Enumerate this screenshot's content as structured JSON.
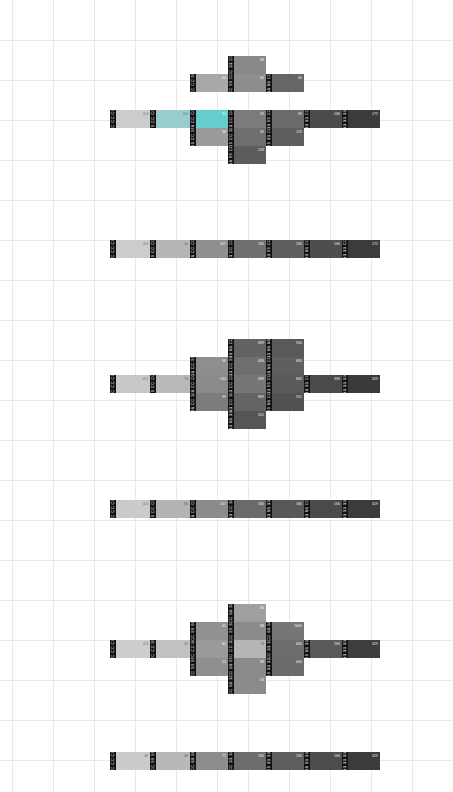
{
  "view": {
    "title": "Web-safe colour palette swatch map",
    "background": "#ffffff",
    "grid_color": "#e9e9e9",
    "badge_bg": "#111111",
    "badge_fg": "#ffffff"
  },
  "grid": {
    "h_lines": [
      40,
      80,
      120,
      160,
      200,
      240,
      280,
      320,
      360,
      400,
      440,
      480,
      520,
      560,
      600,
      640,
      680,
      720,
      760
    ],
    "v_lines": [
      12,
      53,
      94,
      135,
      176,
      217,
      248,
      289,
      330,
      371,
      412,
      453
    ]
  },
  "chart_data": {
    "type": "heatmap",
    "xlabel": "",
    "ylabel": "",
    "clusters": [
      {
        "name": "cluster-1-blue-cross",
        "shape": "cross",
        "cells": [
          {
            "hex": "CC CC CC",
            "color": "#cccccc",
            "pct": "4.3",
            "x": 18,
            "y": 45,
            "w": 40,
            "h": 18,
            "light": true
          },
          {
            "hex": "99 CC CC",
            "color": "#99cccc",
            "pct": "4.5",
            "x": 58,
            "y": 45,
            "w": 40,
            "h": 18,
            "light": true
          },
          {
            "hex": "66 CC CC",
            "color": "#66cccc",
            "pct": "33",
            "x": 98,
            "y": 45,
            "w": 38,
            "h": 18
          },
          {
            "hex": "CC CC 99",
            "color": "#a8a8a8",
            "pct": "64",
            "x": 98,
            "y": 9,
            "w": 38,
            "h": 18
          },
          {
            "hex": "99 CC 99",
            "color": "#9a9a9a",
            "pct": "38",
            "x": 98,
            "y": 63,
            "w": 38,
            "h": 18
          },
          {
            "hex": "33 CC CC",
            "color": "#7b7b7b",
            "pct": "49",
            "x": 136,
            "y": 45,
            "w": 38,
            "h": 18
          },
          {
            "hex": "CC 99 CC",
            "color": "#8d8d8d",
            "pct": "80",
            "x": 136,
            "y": 9,
            "w": 38,
            "h": 18
          },
          {
            "hex": "CC 33 CC",
            "color": "#888888",
            "pct": "88",
            "x": 136,
            "y": -9,
            "w": 38,
            "h": 18
          },
          {
            "hex": "99 CC 33",
            "color": "#6e6e6e",
            "pct": "49",
            "x": 136,
            "y": 63,
            "w": 38,
            "h": 18
          },
          {
            "hex": "66 99 CC",
            "color": "#5c5c5c",
            "pct": "133",
            "x": 136,
            "y": 81,
            "w": 38,
            "h": 18
          },
          {
            "hex": "33 99 CC",
            "color": "#6a6a6a",
            "pct": "98",
            "x": 174,
            "y": 45,
            "w": 38,
            "h": 18
          },
          {
            "hex": "66 66 CC",
            "color": "#666666",
            "pct": "66",
            "x": 174,
            "y": 9,
            "w": 38,
            "h": 18
          },
          {
            "hex": "99 33 CC",
            "color": "#5f5f5f",
            "pct": "119",
            "x": 174,
            "y": 63,
            "w": 38,
            "h": 18
          },
          {
            "hex": "33 33 CC",
            "color": "#4b4b4b",
            "pct": "166",
            "x": 212,
            "y": 45,
            "w": 38,
            "h": 18
          },
          {
            "hex": "33 33 33",
            "color": "#3c3c3c",
            "pct": "172",
            "x": 250,
            "y": 45,
            "w": 38,
            "h": 18
          }
        ]
      },
      {
        "name": "cluster-2-single-row",
        "shape": "row",
        "cells": [
          {
            "hex": "CC CC CC",
            "color": "#cccccc",
            "pct": "3.3",
            "x": 18,
            "y": 0,
            "w": 40,
            "h": 18,
            "light": true
          },
          {
            "hex": "99 CC CC",
            "color": "#b6b6b6",
            "pct": "3s",
            "x": 58,
            "y": 0,
            "w": 40,
            "h": 18,
            "light": true
          },
          {
            "hex": "66 CC CC",
            "color": "#8f8f8f",
            "pct": "107",
            "x": 98,
            "y": 0,
            "w": 38,
            "h": 18
          },
          {
            "hex": "33 CC CC",
            "color": "#6f6f6f",
            "pct": "166",
            "x": 136,
            "y": 0,
            "w": 38,
            "h": 18
          },
          {
            "hex": "33 99 CC",
            "color": "#5f5f5f",
            "pct": "166",
            "x": 174,
            "y": 0,
            "w": 38,
            "h": 18
          },
          {
            "hex": "33 66 CC",
            "color": "#4e4e4e",
            "pct": "166",
            "x": 212,
            "y": 0,
            "w": 38,
            "h": 18
          },
          {
            "hex": "33 33 CC",
            "color": "#3b3b3b",
            "pct": "172",
            "x": 250,
            "y": 0,
            "w": 38,
            "h": 18
          }
        ]
      },
      {
        "name": "cluster-3-large-cross",
        "shape": "cross",
        "cells": [
          {
            "hex": "CC CC CC",
            "color": "#c8c8c8",
            "pct": "4.3",
            "x": 18,
            "y": 45,
            "w": 40,
            "h": 18,
            "light": true
          },
          {
            "hex": "99 CC CC",
            "color": "#b9b9b9",
            "pct": "76",
            "x": 58,
            "y": 45,
            "w": 40,
            "h": 18,
            "light": true
          },
          {
            "hex": "66 CC CC",
            "color": "#8a8a8a",
            "pct": "134",
            "x": 98,
            "y": 45,
            "w": 38,
            "h": 18
          },
          {
            "hex": "66 CC 99",
            "color": "#8e8e8e",
            "pct": "99",
            "x": 98,
            "y": 27,
            "w": 38,
            "h": 18
          },
          {
            "hex": "66 CC 33",
            "color": "#7c7c7c",
            "pct": "99",
            "x": 98,
            "y": 63,
            "w": 38,
            "h": 18
          },
          {
            "hex": "33 CC CC",
            "color": "#767676",
            "pct": "683",
            "x": 136,
            "y": 45,
            "w": 38,
            "h": 18
          },
          {
            "hex": "33 CC 99",
            "color": "#6f6f6f",
            "pct": "683",
            "x": 136,
            "y": 27,
            "w": 38,
            "h": 18
          },
          {
            "hex": "33 66 CC",
            "color": "#636363",
            "pct": "689",
            "x": 136,
            "y": 9,
            "w": 38,
            "h": 18
          },
          {
            "hex": "33 CC 33",
            "color": "#646464",
            "pct": "899",
            "x": 136,
            "y": 63,
            "w": 38,
            "h": 18
          },
          {
            "hex": "33 66 33",
            "color": "#555555",
            "pct": "551",
            "x": 136,
            "y": 81,
            "w": 38,
            "h": 18
          },
          {
            "hex": "33 99 CC",
            "color": "#5a5a5a",
            "pct": "683",
            "x": 174,
            "y": 45,
            "w": 38,
            "h": 18
          },
          {
            "hex": "66 66 CC",
            "color": "#5f5f5f",
            "pct": "683",
            "x": 174,
            "y": 27,
            "w": 38,
            "h": 18
          },
          {
            "hex": "33 66 66",
            "color": "#595959",
            "pct": "944",
            "x": 174,
            "y": 9,
            "w": 38,
            "h": 18
          },
          {
            "hex": "99 66 CC",
            "color": "#525252",
            "pct": "551",
            "x": 174,
            "y": 63,
            "w": 38,
            "h": 18
          },
          {
            "hex": "33 33 CC",
            "color": "#4a4a4a",
            "pct": "336",
            "x": 212,
            "y": 45,
            "w": 38,
            "h": 18
          },
          {
            "hex": "33 33 33",
            "color": "#3a3a3a",
            "pct": "429",
            "x": 250,
            "y": 45,
            "w": 38,
            "h": 18
          }
        ]
      },
      {
        "name": "cluster-4-single-row",
        "shape": "row",
        "cells": [
          {
            "hex": "CC CC CC",
            "color": "#cacaca",
            "pct": "4.3",
            "x": 18,
            "y": 0,
            "w": 40,
            "h": 18,
            "light": true
          },
          {
            "hex": "99 CC CC",
            "color": "#b3b3b3",
            "pct": "80",
            "x": 58,
            "y": 0,
            "w": 40,
            "h": 18,
            "light": true
          },
          {
            "hex": "66 CC CC",
            "color": "#8b8b8b",
            "pct": "107",
            "x": 98,
            "y": 0,
            "w": 38,
            "h": 18
          },
          {
            "hex": "33 CC 33",
            "color": "#6a6a6a",
            "pct": "166",
            "x": 136,
            "y": 0,
            "w": 38,
            "h": 18
          },
          {
            "hex": "33 66 33",
            "color": "#585858",
            "pct": "166",
            "x": 174,
            "y": 0,
            "w": 38,
            "h": 18
          },
          {
            "hex": "33 66 CC",
            "color": "#4a4a4a",
            "pct": "166",
            "x": 212,
            "y": 0,
            "w": 38,
            "h": 18
          },
          {
            "hex": "33 33 33",
            "color": "#3b3b3b",
            "pct": "429",
            "x": 250,
            "y": 0,
            "w": 38,
            "h": 18
          }
        ]
      },
      {
        "name": "cluster-5-cross",
        "shape": "cross",
        "cells": [
          {
            "hex": "CC CC CC",
            "color": "#cdcdcd",
            "pct": "4.3",
            "x": 18,
            "y": 45,
            "w": 40,
            "h": 18,
            "light": true
          },
          {
            "hex": "CC CC 99",
            "color": "#c1c1c1",
            "pct": "55",
            "x": 58,
            "y": 45,
            "w": 40,
            "h": 18,
            "light": true
          },
          {
            "hex": "CC CC 66",
            "color": "#9a9a9a",
            "pct": "45",
            "x": 98,
            "y": 45,
            "w": 38,
            "h": 18
          },
          {
            "hex": "CC 99 66",
            "color": "#919191",
            "pct": "45",
            "x": 98,
            "y": 27,
            "w": 38,
            "h": 18
          },
          {
            "hex": "CC 99 99",
            "color": "#8f8f8f",
            "pct": "53",
            "x": 98,
            "y": 63,
            "w": 38,
            "h": 18
          },
          {
            "hex": "CC CC 33",
            "color": "#b5b5b5",
            "pct": "74",
            "x": 136,
            "y": 45,
            "w": 38,
            "h": 18,
            "light": true
          },
          {
            "hex": "CC 99 33",
            "color": "#8b8b8b",
            "pct": "88",
            "x": 136,
            "y": 27,
            "w": 38,
            "h": 18
          },
          {
            "hex": "CC 66 33",
            "color": "#9f9f9f",
            "pct": "66",
            "x": 136,
            "y": 9,
            "w": 38,
            "h": 18
          },
          {
            "hex": "CC 66 99",
            "color": "#8a8a8a",
            "pct": "88",
            "x": 136,
            "y": 63,
            "w": 38,
            "h": 18
          },
          {
            "hex": "CC 66 33",
            "color": "#8b8b8b",
            "pct": "58",
            "x": 136,
            "y": 81,
            "w": 38,
            "h": 18
          },
          {
            "hex": "CC 33 33",
            "color": "#6d6d6d",
            "pct": "666",
            "x": 174,
            "y": 45,
            "w": 38,
            "h": 18
          },
          {
            "hex": "CC 66 66",
            "color": "#767676",
            "pct": "1666",
            "x": 174,
            "y": 27,
            "w": 38,
            "h": 18
          },
          {
            "hex": "99 33 33",
            "color": "#6b6b6b",
            "pct": "666",
            "x": 174,
            "y": 63,
            "w": 38,
            "h": 18
          },
          {
            "hex": "99 66 33",
            "color": "#595959",
            "pct": "266",
            "x": 212,
            "y": 45,
            "w": 38,
            "h": 18
          },
          {
            "hex": "33 33 33",
            "color": "#3e3e3e",
            "pct": "429",
            "x": 250,
            "y": 45,
            "w": 38,
            "h": 18
          }
        ]
      },
      {
        "name": "cluster-6-single-row",
        "shape": "row",
        "cells": [
          {
            "hex": "CC CC CC",
            "color": "#cbcbcb",
            "pct": "48",
            "x": 18,
            "y": 0,
            "w": 40,
            "h": 18,
            "light": true
          },
          {
            "hex": "CC 99 99",
            "color": "#b8b8b8",
            "pct": "38",
            "x": 58,
            "y": 0,
            "w": 40,
            "h": 18,
            "light": true
          },
          {
            "hex": "CC 66 66",
            "color": "#8d8d8d",
            "pct": "77",
            "x": 98,
            "y": 0,
            "w": 38,
            "h": 18
          },
          {
            "hex": "CC 33 33",
            "color": "#6d6d6d",
            "pct": "166",
            "x": 136,
            "y": 0,
            "w": 38,
            "h": 18
          },
          {
            "hex": "99 33 33",
            "color": "#5d5d5d",
            "pct": "166",
            "x": 174,
            "y": 0,
            "w": 38,
            "h": 18
          },
          {
            "hex": "66 33 33",
            "color": "#4c4c4c",
            "pct": "166",
            "x": 212,
            "y": 0,
            "w": 38,
            "h": 18
          },
          {
            "hex": "33 33 33",
            "color": "#3b3b3b",
            "pct": "429",
            "x": 250,
            "y": 0,
            "w": 38,
            "h": 18
          }
        ]
      }
    ]
  },
  "layout": {
    "cluster_origins": [
      {
        "left": 92,
        "top": 65
      },
      {
        "left": 92,
        "top": 240
      },
      {
        "left": 92,
        "top": 330
      },
      {
        "left": 92,
        "top": 500
      },
      {
        "left": 92,
        "top": 595
      },
      {
        "left": 92,
        "top": 752
      }
    ]
  }
}
